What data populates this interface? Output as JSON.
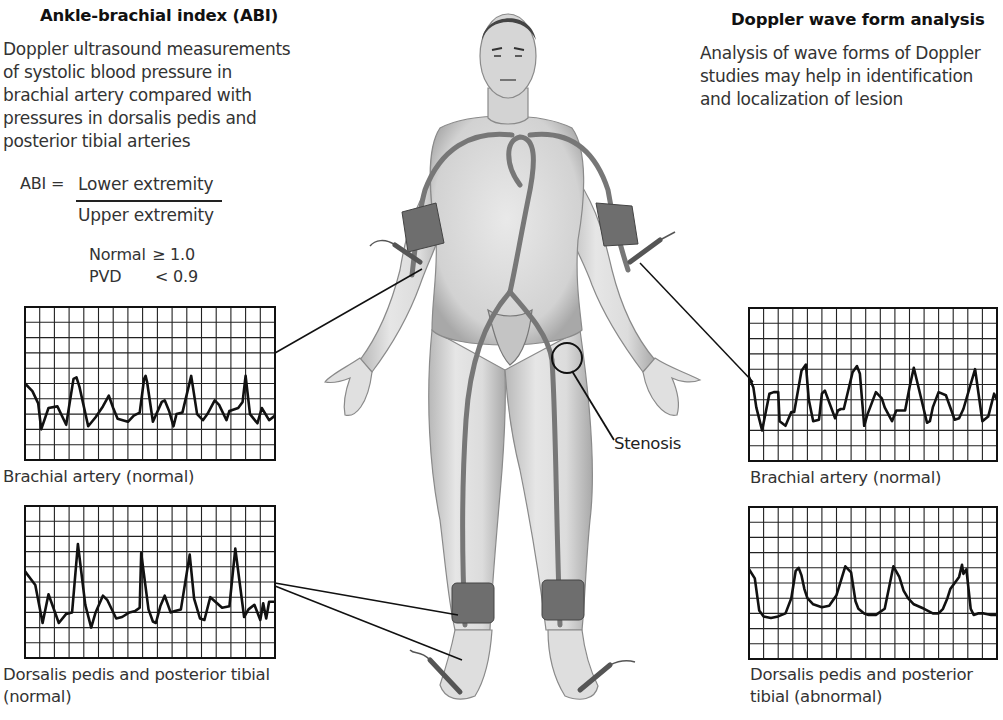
{
  "left_panel": {
    "title": "Ankle-brachial index (ABI)",
    "description_lines": [
      "Doppler ultrasound measurements",
      "of systolic blood pressure in",
      "brachial artery compared with",
      "pressures in dorsalis pedis and",
      "posterior tibial arteries"
    ],
    "formula": {
      "lhs": "ABI =",
      "numerator": "Lower extremity",
      "denominator": "Upper extremity"
    },
    "thresholds": [
      {
        "label": "Normal",
        "value": "≥ 1.0"
      },
      {
        "label": "PVD",
        "value": "< 0.9"
      }
    ]
  },
  "right_panel": {
    "title": "Doppler wave form analysis",
    "description_lines": [
      "Analysis of wave forms of Doppler",
      "studies may help in identification",
      "and localization of lesion"
    ]
  },
  "figure": {
    "stenosis_label": "Stenosis",
    "colors": {
      "skin": "#d9d9d9",
      "skin_shade": "#a8a8a8",
      "artery": "#7a7a7a",
      "cuff": "#6e6e6e",
      "line": "#111111"
    }
  },
  "chart_data": [
    {
      "type": "line",
      "id": "left-brachial",
      "title": "Brachial artery (normal)",
      "grid": {
        "cols": 17,
        "rows": 10
      },
      "xlim": [
        0,
        17
      ],
      "ylim": [
        0,
        10
      ],
      "x": [
        0,
        0.5,
        0.9,
        1.1,
        1.6,
        2.2,
        2.8,
        3.3,
        3.5,
        3.7,
        4.3,
        4.8,
        5.3,
        5.7,
        6.0,
        6.3,
        7.0,
        7.4,
        7.8,
        8.1,
        8.2,
        8.3,
        8.7,
        9.3,
        9.5,
        9.8,
        10.1,
        10.3,
        10.7,
        11.3,
        11.7,
        12.1,
        12.4,
        12.9,
        13.2,
        13.7,
        13.9,
        14.5,
        14.8,
        15.0,
        15.3,
        15.8,
        16.1,
        16.6,
        17.0
      ],
      "y": [
        5.0,
        4.5,
        3.7,
        2.0,
        3.4,
        3.5,
        2.3,
        5.3,
        5.4,
        4.8,
        2.2,
        2.8,
        3.5,
        4.2,
        3.4,
        2.7,
        2.5,
        2.9,
        3.1,
        5.3,
        5.5,
        5.1,
        2.5,
        3.8,
        3.9,
        3.2,
        2.2,
        3.0,
        3.1,
        5.5,
        3.0,
        2.6,
        3.0,
        3.9,
        3.6,
        2.6,
        3.2,
        3.4,
        3.8,
        5.5,
        3.0,
        2.4,
        3.4,
        2.6,
        2.9
      ],
      "color": "#111111"
    },
    {
      "type": "line",
      "id": "left-dorsalis-pedis",
      "title": "Dorsalis pedis and posterior tibial (normal)",
      "grid": {
        "cols": 17,
        "rows": 10
      },
      "xlim": [
        0,
        17
      ],
      "ylim": [
        0,
        10
      ],
      "x": [
        0,
        0.7,
        1.2,
        1.6,
        2.3,
        2.8,
        3.2,
        3.6,
        4.1,
        4.5,
        4.8,
        5.3,
        5.6,
        6.2,
        6.6,
        7.1,
        7.5,
        7.8,
        7.9,
        8.4,
        8.7,
        8.9,
        9.2,
        9.5,
        9.9,
        10.2,
        10.6,
        11.2,
        11.5,
        11.9,
        12.2,
        12.6,
        13.4,
        13.9,
        14.3,
        14.9,
        15.2,
        15.6,
        16.0,
        16.2,
        16.4,
        16.6,
        16.8,
        17.0
      ],
      "y": [
        5.7,
        4.8,
        2.3,
        4.2,
        2.3,
        2.9,
        3.0,
        7.5,
        3.5,
        2.0,
        3.0,
        4.1,
        3.8,
        2.6,
        2.7,
        3.0,
        3.1,
        3.3,
        6.9,
        3.2,
        2.4,
        2.3,
        3.4,
        4.1,
        3.0,
        3.1,
        3.2,
        6.8,
        3.9,
        2.6,
        2.5,
        4.0,
        3.3,
        3.4,
        7.2,
        2.7,
        3.2,
        3.5,
        2.5,
        3.6,
        2.6,
        3.7,
        3.7,
        3.7
      ],
      "color": "#111111"
    },
    {
      "type": "line",
      "id": "right-brachial",
      "title": "Brachial artery (normal)",
      "grid": {
        "cols": 17,
        "rows": 10
      },
      "xlim": [
        0,
        17
      ],
      "ylim": [
        0,
        10
      ],
      "x": [
        0,
        0.3,
        0.5,
        0.9,
        1.4,
        1.7,
        2.0,
        2.1,
        2.5,
        2.9,
        3.1,
        3.6,
        3.9,
        4.1,
        4.4,
        4.8,
        5.0,
        5.2,
        5.9,
        6.1,
        6.3,
        6.5,
        7.1,
        7.4,
        7.6,
        7.9,
        8.1,
        8.7,
        9.1,
        9.3,
        9.8,
        10.1,
        10.7,
        11.0,
        11.3,
        12.2,
        12.4,
        12.6,
        13.0,
        13.5,
        14.1,
        14.4,
        14.7,
        15.5,
        16.0,
        16.4,
        16.8,
        17.0
      ],
      "y": [
        5.5,
        4.8,
        3.5,
        2.0,
        4.4,
        4.5,
        4.5,
        2.6,
        2.3,
        3.2,
        3.2,
        5.9,
        6.3,
        4.0,
        2.6,
        2.7,
        4.4,
        4.6,
        2.8,
        3.3,
        3.4,
        3.4,
        5.8,
        6.2,
        5.7,
        2.3,
        3.0,
        4.5,
        4.1,
        3.5,
        2.6,
        3.3,
        3.3,
        4.8,
        6.1,
        2.5,
        2.6,
        3.5,
        4.5,
        4.3,
        2.7,
        2.8,
        3.4,
        6.0,
        2.6,
        2.9,
        4.4,
        4.0
      ],
      "color": "#111111"
    },
    {
      "type": "line",
      "id": "right-dorsalis-pedis",
      "title": "Dorsalis pedis and posterior tibial (abnormal)",
      "grid": {
        "cols": 17,
        "rows": 10
      },
      "xlim": [
        0,
        17
      ],
      "ylim": [
        0,
        10
      ],
      "x": [
        0,
        0.4,
        0.7,
        1.0,
        1.5,
        2.0,
        2.5,
        2.9,
        3.2,
        3.4,
        3.6,
        3.8,
        4.0,
        4.4,
        5.0,
        5.5,
        6.0,
        6.6,
        7.0,
        7.3,
        7.5,
        7.9,
        8.2,
        8.7,
        9.3,
        9.9,
        10.3,
        10.6,
        10.9,
        11.3,
        12.0,
        12.6,
        13.0,
        13.3,
        13.6,
        13.8,
        14.4,
        14.6,
        14.7,
        14.9,
        15.2,
        15.4,
        15.7,
        16.1,
        16.6,
        17.0
      ],
      "y": [
        5.9,
        5.3,
        3.2,
        2.8,
        2.7,
        2.8,
        3.0,
        4.0,
        5.8,
        6.0,
        5.5,
        4.6,
        4.0,
        3.6,
        3.4,
        3.5,
        4.2,
        6.1,
        5.7,
        3.8,
        3.3,
        3.0,
        2.9,
        2.9,
        3.3,
        6.1,
        5.4,
        4.5,
        4.0,
        3.6,
        3.3,
        3.0,
        3.0,
        3.3,
        4.0,
        4.6,
        5.4,
        6.2,
        5.6,
        5.9,
        3.3,
        2.9,
        3.0,
        3.0,
        2.9,
        2.9
      ],
      "color": "#111111"
    }
  ]
}
